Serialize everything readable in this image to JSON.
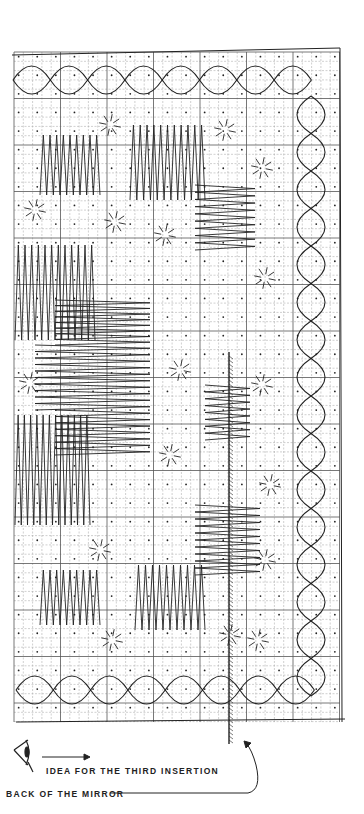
{
  "diagram": {
    "labels": {
      "third_insertion": "IDEA FOR THE THIRD INSERTION",
      "back_of_mirror": "BACK OF THE MIRROR"
    },
    "icons": {
      "eye": "eye-icon",
      "arrow": "right-arrow-icon",
      "curved_arrow": "curved-arrow-icon",
      "mirror": "mirror-hatched-line"
    },
    "colors": {
      "ink": "#1a1a1a",
      "grid": "#9a9a9a",
      "paper": "#ffffff"
    },
    "grid": {
      "left": 14,
      "top": 52,
      "right": 340,
      "bottom": 722,
      "cell": 9.3
    }
  }
}
